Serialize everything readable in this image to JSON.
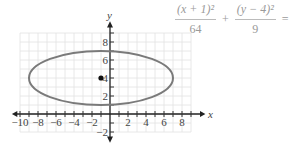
{
  "equation": {
    "term1_numerator": "(x + 1)²",
    "term1_denominator": "64",
    "plus": "+",
    "term2_numerator": "(y − 4)²",
    "term2_denominator": "9",
    "equals": "="
  },
  "chart_data": {
    "type": "ellipse-graph",
    "center": [
      -1,
      4
    ],
    "semi_axis_x": 8,
    "semi_axis_y": 3,
    "marked_point": [
      -1,
      4
    ],
    "xlabel": "x",
    "ylabel": "y",
    "x_tick_labels": [
      "-10",
      "-8",
      "-6",
      "-4",
      "-2",
      "2",
      "4",
      "6",
      "8"
    ],
    "y_tick_labels": [
      "8",
      "6",
      "4",
      "2",
      "-2"
    ],
    "xlim": [
      -10,
      9
    ],
    "ylim": [
      -2,
      9
    ],
    "grid": true
  }
}
